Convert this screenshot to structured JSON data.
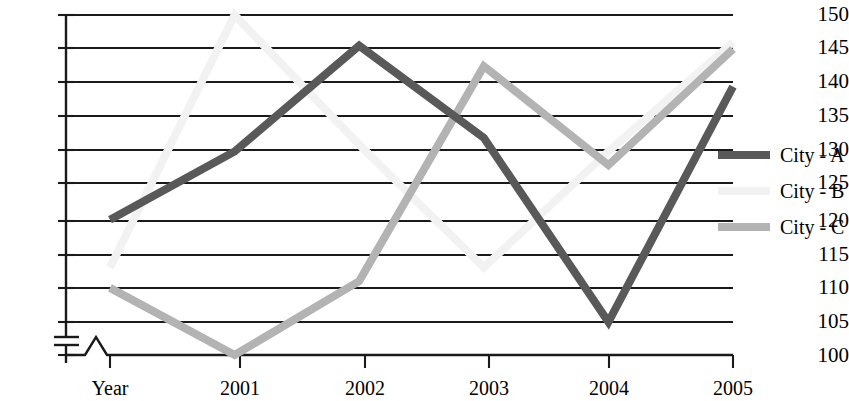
{
  "chart_data": {
    "type": "line",
    "title": "",
    "subtitle": "",
    "xlabel": "",
    "ylabel": "",
    "categories": [
      "Year",
      "2001",
      "2002",
      "2003",
      "2004",
      "2005"
    ],
    "x_tick_labels": [
      "Year",
      "2001",
      "2002",
      "2003",
      "2004",
      "2005"
    ],
    "y_tick_labels": [
      "100",
      "105",
      "110",
      "115",
      "120",
      "125",
      "130",
      "135",
      "140",
      "145",
      "150"
    ],
    "y_tick_values": [
      100,
      105,
      110,
      115,
      120,
      125,
      130,
      135,
      140,
      145,
      150
    ],
    "ylim": [
      100,
      150
    ],
    "y_step": 5,
    "axis_break": true,
    "axis_break_note": "y-axis broken between 100 and 105",
    "grid": true,
    "grid_orientation": "horizontal",
    "legend_position": "right",
    "series": [
      {
        "name": "City - A",
        "color": "#595959",
        "values": [
          120,
          130,
          145.5,
          132,
          105,
          139.5
        ]
      },
      {
        "name": "City - B",
        "color": "#f2f2f2",
        "values": [
          113,
          150,
          131,
          113,
          130,
          146
        ]
      },
      {
        "name": "City - C",
        "color": "#b3b3b3",
        "values": [
          110,
          100,
          111,
          142.5,
          128,
          145
        ]
      }
    ]
  },
  "legend": {
    "entries": [
      {
        "label": "City - A",
        "color": "#595959"
      },
      {
        "label": "City - B",
        "color": "#f2f2f2"
      },
      {
        "label": "City - C",
        "color": "#b3b3b3"
      }
    ]
  },
  "axes": {
    "y": {
      "ticks": [
        {
          "label": "150",
          "value": 150
        },
        {
          "label": "145",
          "value": 145
        },
        {
          "label": "140",
          "value": 140
        },
        {
          "label": "135",
          "value": 135
        },
        {
          "label": "130",
          "value": 130
        },
        {
          "label": "125",
          "value": 125
        },
        {
          "label": "120",
          "value": 120
        },
        {
          "label": "115",
          "value": 115
        },
        {
          "label": "110",
          "value": 110
        },
        {
          "label": "105",
          "value": 105
        },
        {
          "label": "100",
          "value": 100
        }
      ]
    },
    "x": {
      "ticks": [
        {
          "label": "Year"
        },
        {
          "label": "2001"
        },
        {
          "label": "2002"
        },
        {
          "label": "2003"
        },
        {
          "label": "2004"
        },
        {
          "label": "2005"
        }
      ]
    }
  },
  "colors": {
    "axis": "#1a1a1a",
    "grid": "#1a1a1a",
    "background": "#ffffff",
    "series_a": "#595959",
    "series_b": "#f2f2f2",
    "series_c": "#b3b3b3"
  }
}
